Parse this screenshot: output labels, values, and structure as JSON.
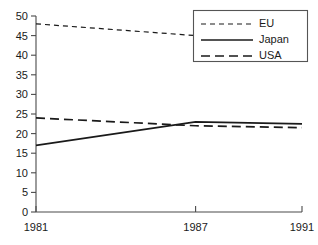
{
  "chart_data": {
    "type": "line",
    "title": "",
    "subtitle": "",
    "xlabel": "",
    "ylabel": "",
    "x": [
      1981,
      1987,
      1991
    ],
    "xlim": [
      1981,
      1991
    ],
    "ylim": [
      0,
      50
    ],
    "ytick_labels": [
      "0",
      "5",
      "10",
      "15",
      "20",
      "25",
      "30",
      "35",
      "40",
      "45",
      "50"
    ],
    "ytick_values": [
      0,
      5,
      10,
      15,
      20,
      25,
      30,
      35,
      40,
      45,
      50
    ],
    "xtick_labels": [
      "1981",
      "1987",
      "1991"
    ],
    "xtick_values": [
      1981,
      1987,
      1991
    ],
    "grid": false,
    "legend_position": "top-right",
    "series": [
      {
        "name": "EU",
        "style": "short-dashed",
        "x": [
          1981,
          1987
        ],
        "values": [
          48,
          45
        ]
      },
      {
        "name": "Japan",
        "style": "solid",
        "x": [
          1981,
          1987,
          1991
        ],
        "values": [
          17,
          23,
          22.5
        ]
      },
      {
        "name": "USA",
        "style": "long-dashed",
        "x": [
          1981,
          1987,
          1991
        ],
        "values": [
          24,
          22,
          21.5
        ]
      }
    ]
  },
  "legend": {
    "entries": [
      {
        "label": "EU"
      },
      {
        "label": "Japan"
      },
      {
        "label": "USA"
      }
    ]
  },
  "colors": {
    "axis": "#4a4a4a",
    "line": "#1a1a1a",
    "text": "#1a1a1a",
    "legend_border": "#555555",
    "background": "#ffffff"
  }
}
